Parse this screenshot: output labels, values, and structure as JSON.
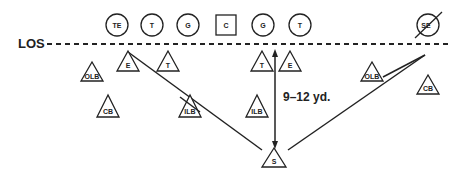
{
  "diagram": {
    "los_label": "LOS",
    "distance_label": "9–12 yd.",
    "offense": [
      {
        "label": "TE",
        "shape": "circle",
        "x": 117,
        "y": 25
      },
      {
        "label": "T",
        "shape": "circle",
        "x": 152,
        "y": 25
      },
      {
        "label": "G",
        "shape": "circle",
        "x": 188,
        "y": 25
      },
      {
        "label": "C",
        "shape": "square",
        "x": 226,
        "y": 25
      },
      {
        "label": "G",
        "shape": "circle",
        "x": 263,
        "y": 25
      },
      {
        "label": "T",
        "shape": "circle",
        "x": 300,
        "y": 25
      },
      {
        "label": "SE",
        "shape": "circle-slashed",
        "x": 428,
        "y": 25
      }
    ],
    "defense": [
      {
        "label": "OLB",
        "x": 92,
        "y": 72
      },
      {
        "label": "E",
        "x": 128,
        "y": 62
      },
      {
        "label": "T",
        "x": 168,
        "y": 62
      },
      {
        "label": "T",
        "x": 262,
        "y": 62
      },
      {
        "label": "E",
        "x": 290,
        "y": 62
      },
      {
        "label": "OLB",
        "x": 372,
        "y": 72
      },
      {
        "label": "CB",
        "x": 428,
        "y": 85
      },
      {
        "label": "CB",
        "x": 108,
        "y": 107
      },
      {
        "label": "ILB",
        "x": 190,
        "y": 107
      },
      {
        "label": "ILB",
        "x": 257,
        "y": 107
      },
      {
        "label": "S",
        "x": 273,
        "y": 160
      }
    ]
  }
}
